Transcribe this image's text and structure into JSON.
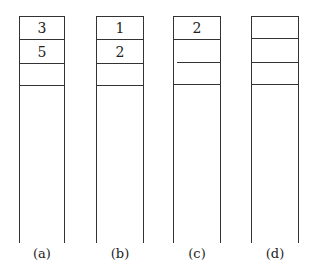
{
  "columns": [
    {
      "label": "(a)",
      "cells": [
        "3",
        "5",
        "",
        ""
      ]
    },
    {
      "label": "(b)",
      "cells": [
        "1",
        "2",
        "",
        ""
      ]
    },
    {
      "label": "(c)",
      "cells": [
        "2",
        "",
        "",
        ""
      ]
    },
    {
      "label": "(d)",
      "cells": [
        "",
        "",
        "",
        ""
      ]
    }
  ]
}
